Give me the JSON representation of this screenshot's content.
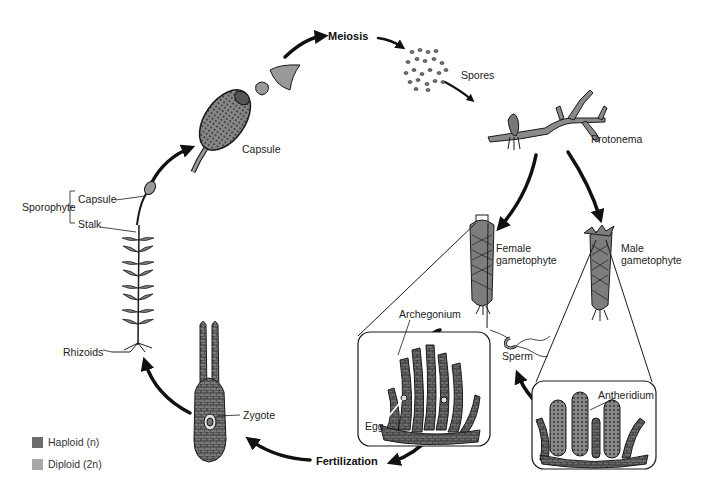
{
  "stages": {
    "meiosis": "Meiosis",
    "fertilization": "Fertilization"
  },
  "labels": {
    "capsule_large": "Capsule",
    "spores": "Spores",
    "protonema": "Protonema",
    "female_gametophyte_1": "Female",
    "female_gametophyte_2": "gametophyte",
    "male_gametophyte_1": "Male",
    "male_gametophyte_2": "gametophyte",
    "archegonium": "Archegonium",
    "egg": "Egg",
    "sperm": "Sperm",
    "antheridium": "Antheridium",
    "zygote": "Zygote",
    "rhizoids": "Rhizoids",
    "sporophyte": "Sporophyte",
    "capsule_small": "Capsule",
    "stalk": "Stalk"
  },
  "legend": {
    "items": [
      {
        "label": "Haploid (n)",
        "color": "#6b6b6b"
      },
      {
        "label": "Diploid (2n)",
        "color": "#a8a8a8"
      }
    ]
  },
  "colors": {
    "haploid": "#6b6b6b",
    "diploid": "#a8a8a8",
    "outline": "#1a1a1a",
    "arrow": "#111111"
  }
}
